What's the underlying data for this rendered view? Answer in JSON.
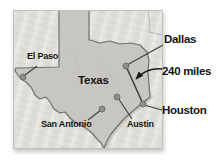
{
  "figure": {
    "type": "map",
    "state_label": "Texas",
    "distance_label": "240 miles",
    "cities": [
      {
        "name": "El Paso",
        "size": "small",
        "dot": {
          "x": 23,
          "y": 77
        },
        "label": {
          "x": 27,
          "y": 52
        },
        "leader": {
          "x1": 37,
          "y1": 66,
          "x2": 25,
          "y2": 75
        }
      },
      {
        "name": "Dallas",
        "size": "large",
        "dot": {
          "x": 126,
          "y": 66
        },
        "label": {
          "x": 164,
          "y": 33
        },
        "leader": {
          "x1": 163,
          "y1": 45,
          "x2": 127,
          "y2": 65
        }
      },
      {
        "name": "Austin",
        "size": "small",
        "dot": {
          "x": 117,
          "y": 97
        },
        "label": {
          "x": 127,
          "y": 120
        },
        "leader": {
          "x1": 118,
          "y1": 98,
          "x2": 132,
          "y2": 119
        }
      },
      {
        "name": "San Antonio",
        "size": "small",
        "dot": {
          "x": 102,
          "y": 109
        },
        "label": {
          "x": 41,
          "y": 120
        },
        "leader": {
          "x1": 101,
          "y1": 110,
          "x2": 88,
          "y2": 120
        }
      },
      {
        "name": "Houston",
        "size": "large",
        "dot": {
          "x": 143,
          "y": 104
        },
        "label": {
          "x": 162,
          "y": 104
        },
        "leader": {
          "x1": 144,
          "y1": 105,
          "x2": 162,
          "y2": 110
        }
      }
    ],
    "distance_line": {
      "x1": 126,
      "y1": 66,
      "x2": 143,
      "y2": 104
    },
    "colors": {
      "page": "#ffffff",
      "land": "#e4e2dc",
      "texas_fill": "#c8c6c1",
      "texas_outline": "#6f6f6d",
      "coast_shade": "#b7b5af",
      "city_dot": "#8f8f8d",
      "city_dot_edge": "#5c5c5a",
      "leader_line": "#3e3e3c",
      "ink": "#1a1a1a",
      "text": "#141414"
    }
  }
}
